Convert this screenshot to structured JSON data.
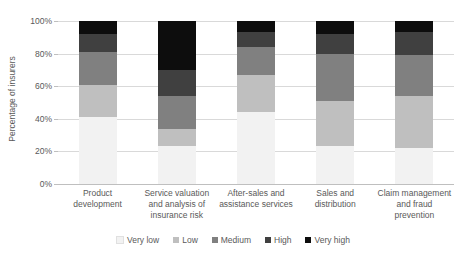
{
  "chart_data": {
    "type": "bar",
    "subtype": "stacked-100-percent",
    "title": "",
    "xlabel": "",
    "ylabel": "Percentage of insurers",
    "ylim": [
      0,
      100
    ],
    "yticks": [
      "0%",
      "20%",
      "40%",
      "60%",
      "80%",
      "100%"
    ],
    "ytick_values": [
      0,
      20,
      40,
      60,
      80,
      100
    ],
    "grid": true,
    "legend_position": "bottom",
    "categories": [
      "Product development",
      "Service valuation and analysis of insurance risk",
      "After-sales and assistance services",
      "Sales and distribution",
      "Claim management and fraud prevention"
    ],
    "category_lines": [
      [
        "Product",
        "development"
      ],
      [
        "Service valuation",
        "and analysis of",
        "insurance risk"
      ],
      [
        "After-sales and",
        "assistance services"
      ],
      [
        "Sales and",
        "distribution"
      ],
      [
        "Claim management",
        "and fraud",
        "prevention"
      ]
    ],
    "series": [
      {
        "name": "Very low",
        "color": "#f2f2f2",
        "values": [
          41,
          23,
          44,
          23,
          22
        ]
      },
      {
        "name": "Low",
        "color": "#bfbfbf",
        "values": [
          20,
          11,
          23,
          28,
          32
        ]
      },
      {
        "name": "Medium",
        "color": "#808080",
        "values": [
          20,
          20,
          17,
          29,
          25
        ]
      },
      {
        "name": "High",
        "color": "#404040",
        "values": [
          11,
          16,
          9,
          12,
          14
        ]
      },
      {
        "name": "Very high",
        "color": "#0d0d0d",
        "values": [
          8,
          30,
          7,
          8,
          7
        ]
      }
    ]
  },
  "legend": {
    "items": [
      {
        "label": "Very low",
        "color": "#f2f2f2"
      },
      {
        "label": "Low",
        "color": "#bfbfbf"
      },
      {
        "label": "Medium",
        "color": "#808080"
      },
      {
        "label": "High",
        "color": "#404040"
      },
      {
        "label": "Very high",
        "color": "#0d0d0d"
      }
    ]
  },
  "axis": {
    "y_title": "Percentage of insurers"
  },
  "colors": {
    "grid": "#d9d9d9",
    "axis": "#bfbfbf",
    "text": "#595959",
    "background": "#ffffff"
  }
}
